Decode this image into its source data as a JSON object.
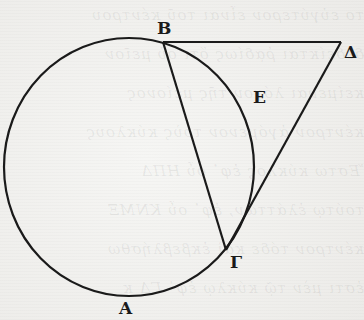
{
  "figure": {
    "labels": {
      "A": "A",
      "B": "B",
      "G": "Γ",
      "D": "Δ",
      "E": "E"
    },
    "geometry": {
      "circle": {
        "cx": 129,
        "cy": 167,
        "rx": 125,
        "ry": 129
      },
      "points": {
        "B": [
          163,
          42
        ],
        "D": [
          341,
          42
        ],
        "G": [
          226,
          250
        ]
      },
      "segments": [
        [
          "B",
          "D"
        ],
        [
          "B",
          "G"
        ],
        [
          "D",
          "G"
        ]
      ]
    },
    "stroke_color": "#1a1a1a",
    "background_color": "#f1f1ef"
  },
  "bleed_through_text": [
    "το εὐγύτερον εἶναι τοῦ κέντρου",
    "δεδείκται ῥᾳδίως ὅτι οὐ μεῖον",
    "κείμεναι λόγον τῆς μείονος",
    "κέντρον ἀγόμενον τοὺς κύκλους",
    "Ἔστω κύκλος ἐφ᾽ οὗ ΗΠΔ",
    "τούτῳ ἐλάττων, ἐφ᾽ οὗ ΚΝΜΞ",
    "κέντρον τόδε καὶ ἐκβεβλήσθω",
    "ἐστι μὲν τῷ κύκλῳ ἐφ᾽ ΓΔ κ"
  ]
}
